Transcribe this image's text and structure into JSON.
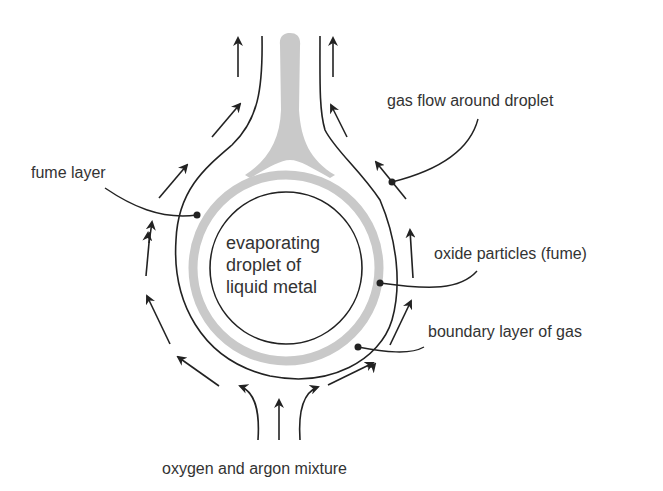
{
  "diagram": {
    "labels": {
      "gas_flow": "gas flow around droplet",
      "fume_layer": "fume layer",
      "oxide_particles": "oxide particles (fume)",
      "boundary_layer": "boundary layer of gas",
      "gas_mixture": "oxygen and argon mixture"
    },
    "center_label": {
      "line1": "evaporating",
      "line2": "droplet of",
      "line3": "liquid metal"
    },
    "colors": {
      "line": "#222222",
      "fume": "#c9c9c9",
      "text": "#333333",
      "background": "#ffffff"
    }
  }
}
